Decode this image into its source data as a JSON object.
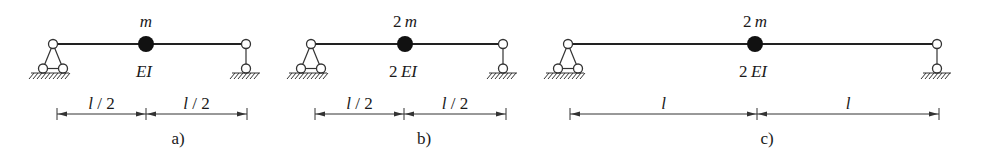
{
  "colors": {
    "ink": "#222222",
    "background": "#ffffff",
    "mass": "#111111"
  },
  "panels": [
    {
      "id": "a",
      "caption": "a)",
      "mass_label": "m",
      "stiffness_label": "EI",
      "span_labels": [
        "l / 2",
        "l / 2"
      ],
      "left_support": "pinned (triangle on two rollers)",
      "right_support": "pendulum link / roller",
      "geometry": {
        "x_left": 53,
        "x_mass": 146,
        "x_right": 246,
        "dim_left": 57,
        "dim_mid": 146,
        "dim_right": 247,
        "caption_x": 178
      }
    },
    {
      "id": "b",
      "caption": "b)",
      "mass_label": "2m",
      "stiffness_label": "2EI",
      "span_labels": [
        "l / 2",
        "l / 2"
      ],
      "left_support": "pinned (triangle on two rollers)",
      "right_support": "pendulum link / roller",
      "geometry": {
        "x_left": 311,
        "x_mass": 405,
        "x_right": 503,
        "dim_left": 315,
        "dim_mid": 404,
        "dim_right": 506,
        "caption_x": 424
      }
    },
    {
      "id": "c",
      "caption": "c)",
      "mass_label": "2m",
      "stiffness_label": "2EI",
      "span_labels": [
        "l",
        "l"
      ],
      "left_support": "pinned (triangle on two rollers)",
      "right_support": "pendulum link / roller",
      "geometry": {
        "x_left": 568,
        "x_mass": 755,
        "x_right": 937,
        "dim_left": 570,
        "dim_mid": 757,
        "dim_right": 939,
        "caption_x": 767
      }
    }
  ]
}
